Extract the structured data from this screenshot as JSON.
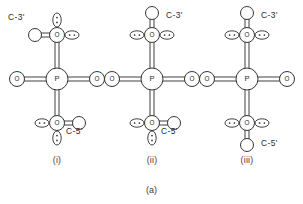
{
  "figure": {
    "caption": "(a)",
    "background": "#ffffff",
    "stroke": "#2b2b2b",
    "fill": "#ffffff"
  },
  "atom_labels": {
    "phosphorus": "P",
    "oxygen": "O"
  },
  "panels": [
    {
      "id": "i",
      "roman_label": "(i)",
      "cx": 57,
      "top_label": "C-3'",
      "bottom_label": "C-5'",
      "top_substituent_dir": "left",
      "bottom_substituent_dir": "right",
      "top_lone_pairs": [
        "up",
        "right"
      ],
      "bottom_lone_pairs": [
        "left",
        "down"
      ],
      "top_label_x": 8,
      "top_label_y": 20,
      "bottom_label_x": 66,
      "bottom_label_y": 134
    },
    {
      "id": "ii",
      "roman_label": "(ii)",
      "cx": 152,
      "top_label": "C-3'",
      "bottom_label": "C-5'",
      "top_substituent_dir": "up",
      "bottom_substituent_dir": "right",
      "top_lone_pairs": [
        "left",
        "right"
      ],
      "bottom_lone_pairs": [
        "left",
        "down"
      ],
      "top_label_x": 166,
      "top_label_y": 18,
      "bottom_label_x": 161,
      "bottom_label_y": 134
    },
    {
      "id": "iii",
      "roman_label": "(iii)",
      "cx": 247,
      "top_label": "C-3'",
      "bottom_label": "C-5'",
      "top_substituent_dir": "up",
      "bottom_substituent_dir": "down",
      "top_lone_pairs": [
        "left",
        "right"
      ],
      "bottom_lone_pairs": [
        "left",
        "right"
      ],
      "top_label_x": 261,
      "top_label_y": 18,
      "bottom_label_x": 261,
      "bottom_label_y": 146
    }
  ],
  "geometry": {
    "p_cy": 79,
    "o_top_cy": 35,
    "o_bottom_cy": 123,
    "o_side_dx": 40,
    "p_r": 11,
    "o_r": 7.5,
    "c_r": 6.5,
    "sub_dist": 22,
    "lone_rx": 7,
    "lone_ry": 4.2,
    "lone_dist": 15,
    "bond_gap": 2.0
  },
  "roman_row_y": 163,
  "caption_y": 193
}
